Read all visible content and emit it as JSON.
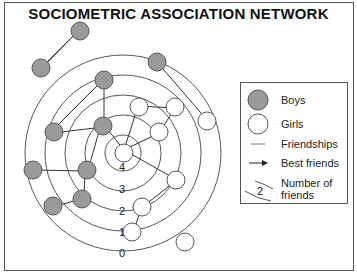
{
  "title": "SOCIOMETRIC ASSOCIATION NETWORK",
  "colors": {
    "boy_fill": "#9a9a9a",
    "girl_fill": "#ffffff",
    "line": "#333333"
  },
  "ring_labels": [
    "4",
    "3",
    "2",
    "1",
    "0"
  ],
  "legend": {
    "boys": "Boys",
    "girls": "Girls",
    "friendships": "Friendships",
    "best_friends": "Best friends",
    "number_of_friends_line1": "Number of",
    "number_of_friends_line2": "friends",
    "sample_number": "2"
  }
}
